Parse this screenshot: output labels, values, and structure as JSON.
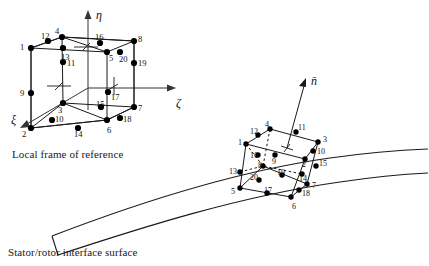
{
  "figure": {
    "type": "diagram",
    "captions": {
      "local_frame": "Local frame of reference",
      "interface_surface": "Stator/rotor interface surface"
    },
    "colors": {
      "line": "#1a1a1a",
      "node_fill": "#000000",
      "background": "#ffffff",
      "axis": "#333333"
    }
  },
  "axes": {
    "eta": {
      "label": "η",
      "name": "eta-axis",
      "x": 96,
      "y": 8
    },
    "zeta": {
      "label": "ζ",
      "name": "zeta-axis",
      "x": 176,
      "y": 96
    },
    "xi": {
      "label": "ξ",
      "name": "xi-axis",
      "x": 11,
      "y": 113
    },
    "normal": {
      "label": "n̄",
      "name": "normal-vector",
      "x": 311,
      "y": 74
    }
  },
  "local_element": {
    "name": "local-frame-element",
    "nodes": [
      {
        "id": "1",
        "x": 31,
        "y": 48,
        "lx": 20,
        "ly": 43
      },
      {
        "id": "2",
        "x": 31,
        "y": 128,
        "lx": 22,
        "ly": 130
      },
      {
        "id": "3",
        "x": 63,
        "y": 103,
        "lx": 58,
        "ly": 106
      },
      {
        "id": "4",
        "x": 62,
        "y": 37,
        "lx": 55,
        "ly": 27
      },
      {
        "id": "5",
        "x": 107,
        "y": 52,
        "lx": 109,
        "ly": 54
      },
      {
        "id": "6",
        "x": 107,
        "y": 120,
        "lx": 107,
        "ly": 126
      },
      {
        "id": "7",
        "x": 134,
        "y": 107,
        "lx": 138,
        "ly": 104
      },
      {
        "id": "8",
        "x": 134,
        "y": 41,
        "lx": 138,
        "ly": 35
      },
      {
        "id": "9",
        "x": 31,
        "y": 93,
        "lx": 20,
        "ly": 89
      },
      {
        "id": "10",
        "x": 52,
        "y": 120,
        "lx": 55,
        "ly": 115
      },
      {
        "id": "11",
        "x": 63,
        "y": 62,
        "lx": 67,
        "ly": 59
      },
      {
        "id": "12",
        "x": 48,
        "y": 41,
        "lx": 41,
        "ly": 32
      },
      {
        "id": "13",
        "x": 63,
        "y": 48,
        "lx": 61,
        "ly": 53
      },
      {
        "id": "14",
        "x": 78,
        "y": 128,
        "lx": 74,
        "ly": 130
      },
      {
        "id": "15",
        "x": 101,
        "y": 107,
        "lx": 96,
        "ly": 100
      },
      {
        "id": "16",
        "x": 100,
        "y": 43,
        "lx": 95,
        "ly": 33
      },
      {
        "id": "17",
        "x": 108,
        "y": 92,
        "lx": 111,
        "ly": 93
      },
      {
        "id": "18",
        "x": 120,
        "y": 118,
        "lx": 123,
        "ly": 115
      },
      {
        "id": "19",
        "x": 134,
        "y": 63,
        "lx": 138,
        "ly": 59
      },
      {
        "id": "20",
        "x": 120,
        "y": 52,
        "lx": 119,
        "ly": 55
      }
    ]
  },
  "surface_element": {
    "name": "interface-element",
    "nodes": [
      {
        "id": "1",
        "x": 246,
        "y": 144,
        "lx": 238,
        "ly": 139
      },
      {
        "id": "2",
        "x": 305,
        "y": 159,
        "lx": 302,
        "ly": 161
      },
      {
        "id": "3",
        "x": 318,
        "y": 142,
        "lx": 323,
        "ly": 136
      },
      {
        "id": "4",
        "x": 270,
        "y": 129,
        "lx": 265,
        "ly": 121
      },
      {
        "id": "5",
        "x": 240,
        "y": 188,
        "lx": 231,
        "ly": 188
      },
      {
        "id": "6",
        "x": 291,
        "y": 197,
        "lx": 292,
        "ly": 203
      },
      {
        "id": "7",
        "x": 307,
        "y": 184,
        "lx": 312,
        "ly": 182
      },
      {
        "id": "8",
        "x": 263,
        "y": 166,
        "lx": 258,
        "ly": 162
      },
      {
        "id": "9",
        "x": 275,
        "y": 155,
        "lx": 272,
        "ly": 158
      },
      {
        "id": "10",
        "x": 313,
        "y": 151,
        "lx": 317,
        "ly": 148
      },
      {
        "id": "11",
        "x": 296,
        "y": 132,
        "lx": 298,
        "ly": 124
      },
      {
        "id": "12",
        "x": 258,
        "y": 135,
        "lx": 250,
        "ly": 128
      },
      {
        "id": "13",
        "x": 240,
        "y": 172,
        "lx": 229,
        "ly": 168
      },
      {
        "id": "14",
        "x": 302,
        "y": 174,
        "lx": 299,
        "ly": 175
      },
      {
        "id": "15",
        "x": 316,
        "y": 166,
        "lx": 319,
        "ly": 160
      },
      {
        "id": "16",
        "x": 258,
        "y": 155,
        "lx": 250,
        "ly": 152
      },
      {
        "id": "17",
        "x": 267,
        "y": 193,
        "lx": 264,
        "ly": 187
      },
      {
        "id": "18",
        "x": 299,
        "y": 190,
        "lx": 302,
        "ly": 190
      },
      {
        "id": "19",
        "x": 282,
        "y": 175,
        "lx": 277,
        "ly": 169
      },
      {
        "id": "20",
        "x": 259,
        "y": 180,
        "lx": 250,
        "ly": 174
      }
    ]
  }
}
